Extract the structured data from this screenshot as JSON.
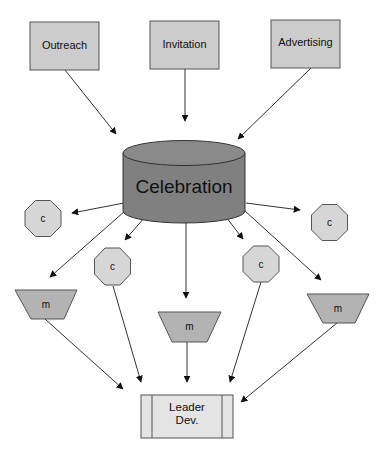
{
  "diagram": {
    "colors": {
      "box_fill": "#cccccc",
      "box_stroke": "#555555",
      "cylinder_fill": "#808080",
      "octagon_fill": "#d6d6d6",
      "trapezoid_fill": "#b3b3b3",
      "leader_fill": "#e4e4e4",
      "edge": "#333333"
    },
    "sources": [
      {
        "id": "outreach",
        "label": "Outreach"
      },
      {
        "id": "invitation",
        "label": "Invitation"
      },
      {
        "id": "advertising",
        "label": "Advertising"
      }
    ],
    "hub": {
      "id": "celebration",
      "label": "Celebration"
    },
    "octagons": [
      {
        "id": "c1",
        "label": "c"
      },
      {
        "id": "c2",
        "label": "c"
      },
      {
        "id": "c3",
        "label": "c"
      },
      {
        "id": "c4",
        "label": "c"
      }
    ],
    "trapezoids": [
      {
        "id": "m1",
        "label": "m"
      },
      {
        "id": "m2",
        "label": "m"
      },
      {
        "id": "m3",
        "label": "m"
      }
    ],
    "sink": {
      "id": "leader_dev",
      "label_line1": "Leader",
      "label_line2": "Dev."
    },
    "edges": [
      [
        "outreach",
        "celebration"
      ],
      [
        "invitation",
        "celebration"
      ],
      [
        "advertising",
        "celebration"
      ],
      [
        "celebration",
        "c1"
      ],
      [
        "celebration",
        "c2"
      ],
      [
        "celebration",
        "c3"
      ],
      [
        "celebration",
        "c4"
      ],
      [
        "celebration",
        "m1"
      ],
      [
        "celebration",
        "m2"
      ],
      [
        "celebration",
        "m3"
      ],
      [
        "m1",
        "leader_dev"
      ],
      [
        "c2",
        "leader_dev"
      ],
      [
        "m2",
        "leader_dev"
      ],
      [
        "c4",
        "leader_dev"
      ],
      [
        "m3",
        "leader_dev"
      ]
    ]
  }
}
